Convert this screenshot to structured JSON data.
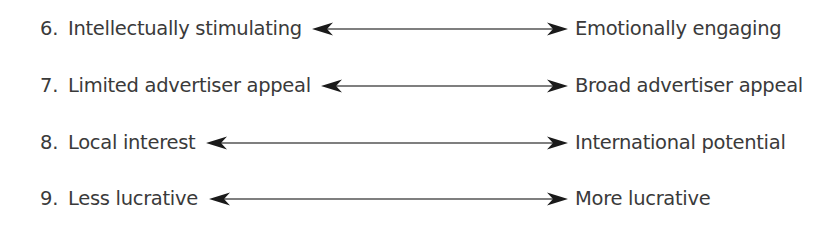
{
  "diagram": {
    "type": "bipolar-scale",
    "items": [
      {
        "number": "6.",
        "left": "Intellectually stimulating",
        "right": "Emotionally engaging",
        "top": 13,
        "left_text_x": 68,
        "arrow_x1": 312,
        "arrow_x2": 568
      },
      {
        "number": "7.",
        "left": "Limited advertiser appeal",
        "right": "Broad advertiser appeal",
        "top": 70,
        "left_text_x": 68,
        "arrow_x1": 321,
        "arrow_x2": 568
      },
      {
        "number": "8.",
        "left": "Local interest",
        "right": "International potential",
        "top": 127,
        "left_text_x": 68,
        "arrow_x1": 206,
        "arrow_x2": 568
      },
      {
        "number": "9.",
        "left": "Less lucrative",
        "right": "More lucrative",
        "top": 183,
        "left_text_x": 68,
        "arrow_x1": 209,
        "arrow_x2": 568
      }
    ],
    "colors": {
      "text": "#3a3a3a",
      "arrow": "#1a1a1a",
      "line": "#555555"
    }
  }
}
